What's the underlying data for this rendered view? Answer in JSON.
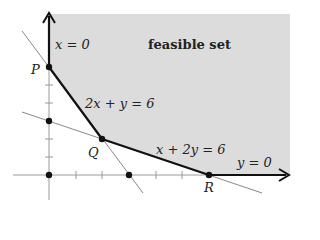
{
  "title": "feasible set",
  "labels": {
    "feasible": "feasible set",
    "x_axis_eq": "x = 0",
    "y_axis_eq": "y = 0",
    "line1": "2x + y = 6",
    "line2": "x + 2y = 6",
    "P": "P",
    "Q": "Q",
    "R": "R"
  },
  "points": {
    "P": [
      0,
      6
    ],
    "Q": [
      2,
      2
    ],
    "R": [
      6,
      0
    ],
    "line1_x_intercept": [
      3,
      0
    ],
    "line2_y_intercept": [
      0,
      3
    ],
    "origin": [
      0,
      0
    ]
  },
  "colors": {
    "region": "#dcdcdc",
    "boundary": "#111111",
    "thin_line": "#888888",
    "axis": "#999999"
  }
}
